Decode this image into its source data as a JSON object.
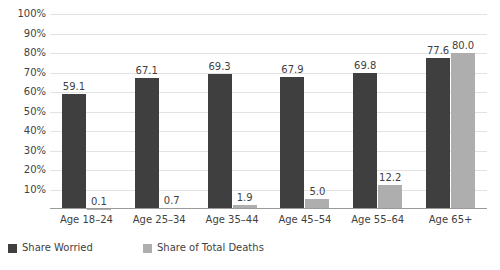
{
  "chart_data": {
    "type": "bar",
    "title": "",
    "subtitle": "",
    "xlabel": "",
    "ylabel": "",
    "ylim": [
      0,
      100
    ],
    "grid": true,
    "legend_position": "bottom-left",
    "categories": [
      "Age 18–24",
      "Age 25–34",
      "Age 35–44",
      "Age 45–54",
      "Age 55–64",
      "Age 65+"
    ],
    "ytick_labels": [
      "100%",
      "90%",
      "80%",
      "70%",
      "60%",
      "50%",
      "40%",
      "30%",
      "20%",
      "10%"
    ],
    "ytick_values": [
      100,
      90,
      80,
      70,
      60,
      50,
      40,
      30,
      20,
      10
    ],
    "series": [
      {
        "name": "Share Worried",
        "color": "#3f3f3f",
        "values": [
          59.1,
          67.1,
          69.3,
          67.9,
          69.8,
          77.6
        ],
        "labels": [
          "59.1",
          "67.1",
          "69.3",
          "67.9",
          "69.8",
          "77.6"
        ]
      },
      {
        "name": "Share of Total Deaths",
        "color": "#aeaeae",
        "values": [
          0.1,
          0.7,
          1.9,
          5.0,
          12.2,
          80.0
        ],
        "labels": [
          "0.1",
          "0.7",
          "1.9",
          "5.0",
          "12.2",
          "80.0"
        ]
      }
    ]
  },
  "legend": {
    "items": [
      {
        "label": "Share Worried",
        "color": "#3f3f3f"
      },
      {
        "label": "Share of Total Deaths",
        "color": "#aeaeae"
      }
    ]
  }
}
